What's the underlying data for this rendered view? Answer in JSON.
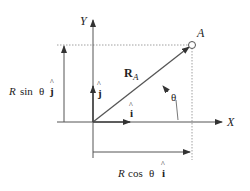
{
  "diagram": {
    "axes": {
      "x_label": "X",
      "y_label": "Y"
    },
    "point": {
      "label": "A"
    },
    "vector": {
      "symbol": "R",
      "subscript": "A"
    },
    "angle": {
      "label": "θ"
    },
    "unit_vectors": {
      "i_label": "i",
      "j_label": "j",
      "hat": "^"
    },
    "components": {
      "vertical": {
        "prefix": "R",
        "func": "sin",
        "angle": "θ",
        "unit": "j"
      },
      "horizontal": {
        "prefix": "R",
        "func": "cos",
        "angle": "θ",
        "unit": "i"
      }
    },
    "colors": {
      "line": "#555555",
      "dotted": "#888888",
      "text": "#222222"
    }
  }
}
